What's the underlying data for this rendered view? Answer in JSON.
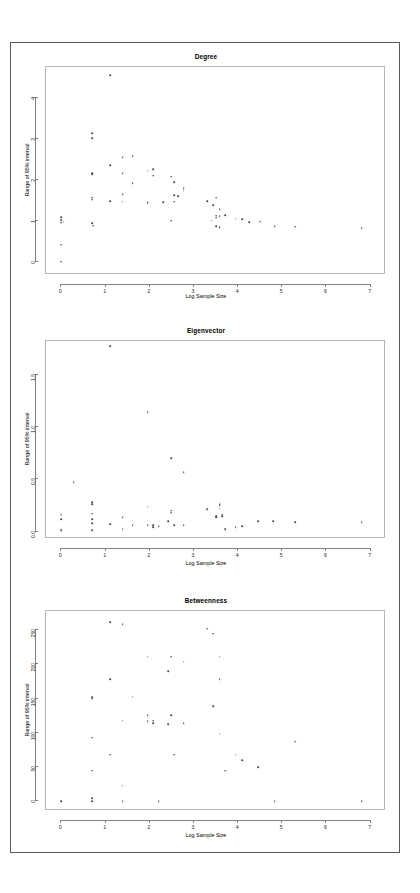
{
  "document": {
    "background_color": "#ffffff",
    "frame_color": "#595959",
    "point_color": "#4a4a4a",
    "axis_color": "#808080"
  },
  "panels": [
    {
      "key": "degree",
      "title": "Degree",
      "xlabel": "Log Sample Size",
      "ylabel": "Range of 95% interval"
    },
    {
      "key": "eigenvector",
      "title": "Eigenvector",
      "xlabel": "Log Sample Size",
      "ylabel": "Range of 95% interval"
    },
    {
      "key": "betweenness",
      "title": "Betweenness",
      "xlabel": "Log Sample Size",
      "ylabel": "Range of 95% interval"
    }
  ],
  "chart_data": [
    {
      "type": "scatter",
      "title": "Degree",
      "xlabel": "Log Sample Size",
      "ylabel": "Range of 95% interval",
      "xlim": [
        -0.35,
        7.35
      ],
      "ylim": [
        -0.32,
        4.75
      ],
      "xticks": [
        0,
        1,
        2,
        3,
        4,
        5,
        6,
        7
      ],
      "xtick_labels": [
        "0",
        "1",
        "2",
        "3",
        "4",
        "5",
        "6",
        "7"
      ],
      "yticks": [
        0,
        1,
        2,
        3,
        4
      ],
      "ytick_labels": [
        "0",
        "1",
        "2",
        "3",
        "4"
      ],
      "grid": false,
      "legend": null,
      "points": [
        [
          0.0,
          0.0
        ],
        [
          0.0,
          0.42
        ],
        [
          0.0,
          0.95
        ],
        [
          0.0,
          1.0
        ],
        [
          0.0,
          1.03
        ],
        [
          0.0,
          1.09
        ],
        [
          0.05,
          0.98
        ],
        [
          0.69,
          3.02
        ],
        [
          0.69,
          3.13
        ],
        [
          0.69,
          2.16
        ],
        [
          0.69,
          2.13
        ],
        [
          0.69,
          1.56
        ],
        [
          0.69,
          1.52
        ],
        [
          0.69,
          0.94
        ],
        [
          0.72,
          0.88
        ],
        [
          1.1,
          4.55
        ],
        [
          1.1,
          2.36
        ],
        [
          1.1,
          1.48
        ],
        [
          1.39,
          2.16
        ],
        [
          1.39,
          1.65
        ],
        [
          1.39,
          2.55
        ],
        [
          1.39,
          1.47
        ],
        [
          1.61,
          2.57
        ],
        [
          1.61,
          1.92
        ],
        [
          1.95,
          2.22
        ],
        [
          1.95,
          1.45
        ],
        [
          1.95,
          1.42
        ],
        [
          2.08,
          2.26
        ],
        [
          2.08,
          2.1
        ],
        [
          2.3,
          1.45
        ],
        [
          2.48,
          2.08
        ],
        [
          2.48,
          1.0
        ],
        [
          2.56,
          1.94
        ],
        [
          2.56,
          1.63
        ],
        [
          2.56,
          1.47
        ],
        [
          2.64,
          1.6
        ],
        [
          2.77,
          1.79
        ],
        [
          2.77,
          1.73
        ],
        [
          3.3,
          1.48
        ],
        [
          3.4,
          1.0
        ],
        [
          3.43,
          1.38
        ],
        [
          3.5,
          1.56
        ],
        [
          3.5,
          1.13
        ],
        [
          3.5,
          1.08
        ],
        [
          3.5,
          0.87
        ],
        [
          3.58,
          1.28
        ],
        [
          3.58,
          1.12
        ],
        [
          3.58,
          0.85
        ],
        [
          3.58,
          0.83
        ],
        [
          3.71,
          1.14
        ],
        [
          3.95,
          1.05
        ],
        [
          4.09,
          1.04
        ],
        [
          4.25,
          0.97
        ],
        [
          4.5,
          0.98
        ],
        [
          4.83,
          0.87
        ],
        [
          5.3,
          0.86
        ],
        [
          6.8,
          0.82
        ]
      ]
    },
    {
      "type": "scatter",
      "title": "Eigenvector",
      "xlabel": "Log Sample Size",
      "ylabel": "Range of 95% interval",
      "xlim": [
        -0.35,
        7.35
      ],
      "ylim": [
        -0.07,
        1.82
      ],
      "xticks": [
        0,
        1,
        2,
        3,
        4,
        5,
        6,
        7
      ],
      "xtick_labels": [
        "0",
        "1",
        "2",
        "3",
        "4",
        "5",
        "6",
        "7"
      ],
      "yticks": [
        0.0,
        0.5,
        1.0,
        1.5
      ],
      "ytick_labels": [
        "0.0",
        "0.5",
        "1.0",
        "1.5"
      ],
      "grid": false,
      "legend": null,
      "points": [
        [
          0.0,
          0.01
        ],
        [
          0.0,
          0.02
        ],
        [
          0.0,
          0.12
        ],
        [
          0.0,
          0.16
        ],
        [
          0.28,
          0.47
        ],
        [
          0.69,
          0.01
        ],
        [
          0.69,
          0.02
        ],
        [
          0.69,
          0.08
        ],
        [
          0.69,
          0.12
        ],
        [
          0.69,
          0.17
        ],
        [
          0.69,
          0.26
        ],
        [
          0.69,
          0.28
        ],
        [
          1.1,
          1.77
        ],
        [
          1.1,
          0.07
        ],
        [
          1.39,
          0.02
        ],
        [
          1.39,
          0.03
        ],
        [
          1.39,
          0.14
        ],
        [
          1.61,
          0.06
        ],
        [
          1.95,
          1.14
        ],
        [
          1.95,
          0.24
        ],
        [
          1.95,
          0.06
        ],
        [
          2.08,
          0.04
        ],
        [
          2.08,
          0.06
        ],
        [
          2.2,
          0.05
        ],
        [
          2.42,
          0.1
        ],
        [
          2.48,
          0.7
        ],
        [
          2.48,
          0.2
        ],
        [
          2.48,
          0.18
        ],
        [
          2.56,
          0.06
        ],
        [
          2.77,
          0.57
        ],
        [
          2.77,
          0.06
        ],
        [
          3.3,
          0.22
        ],
        [
          3.3,
          0.21
        ],
        [
          3.5,
          0.15
        ],
        [
          3.5,
          0.14
        ],
        [
          3.58,
          0.25
        ],
        [
          3.58,
          0.26
        ],
        [
          3.58,
          0.22
        ],
        [
          3.64,
          0.16
        ],
        [
          3.64,
          0.15
        ],
        [
          3.71,
          0.02
        ],
        [
          3.71,
          0.03
        ],
        [
          3.95,
          0.04
        ],
        [
          4.09,
          0.05
        ],
        [
          4.45,
          0.1
        ],
        [
          4.8,
          0.1
        ],
        [
          5.3,
          0.09
        ],
        [
          6.8,
          0.09
        ]
      ]
    },
    {
      "type": "scatter",
      "title": "Betweenness",
      "xlabel": "Log Sample Size",
      "ylabel": "Range of 95% interval",
      "xlim": [
        -0.35,
        7.35
      ],
      "ylim": [
        -14,
        278
      ],
      "xticks": [
        0,
        1,
        2,
        3,
        4,
        5,
        6,
        7
      ],
      "xtick_labels": [
        "0",
        "1",
        "2",
        "3",
        "4",
        "5",
        "6",
        "7"
      ],
      "yticks": [
        0,
        50,
        100,
        150,
        200,
        250
      ],
      "ytick_labels": [
        "0",
        "50",
        "100",
        "150",
        "200",
        "250"
      ],
      "grid": false,
      "legend": null,
      "points": [
        [
          0.0,
          0.5
        ],
        [
          0.69,
          0.5
        ],
        [
          0.69,
          5
        ],
        [
          0.69,
          45
        ],
        [
          0.69,
          93
        ],
        [
          0.69,
          150
        ],
        [
          0.69,
          152
        ],
        [
          1.1,
          262
        ],
        [
          1.1,
          178
        ],
        [
          1.1,
          68
        ],
        [
          1.39,
          259
        ],
        [
          1.39,
          118
        ],
        [
          1.39,
          23
        ],
        [
          1.39,
          0.5
        ],
        [
          1.61,
          153
        ],
        [
          1.95,
          211
        ],
        [
          1.95,
          126
        ],
        [
          1.95,
          117
        ],
        [
          2.08,
          114
        ],
        [
          2.08,
          118
        ],
        [
          2.2,
          0.5
        ],
        [
          2.42,
          190
        ],
        [
          2.42,
          113
        ],
        [
          2.48,
          211
        ],
        [
          2.48,
          126
        ],
        [
          2.56,
          68
        ],
        [
          2.77,
          204
        ],
        [
          2.77,
          114
        ],
        [
          3.3,
          252
        ],
        [
          3.43,
          245
        ],
        [
          3.43,
          139
        ],
        [
          3.58,
          211
        ],
        [
          3.58,
          178
        ],
        [
          3.58,
          99
        ],
        [
          3.71,
          45
        ],
        [
          3.95,
          68
        ],
        [
          4.09,
          60
        ],
        [
          4.45,
          50
        ],
        [
          4.83,
          0.5
        ],
        [
          5.3,
          87
        ],
        [
          6.8,
          0.5
        ]
      ]
    }
  ]
}
